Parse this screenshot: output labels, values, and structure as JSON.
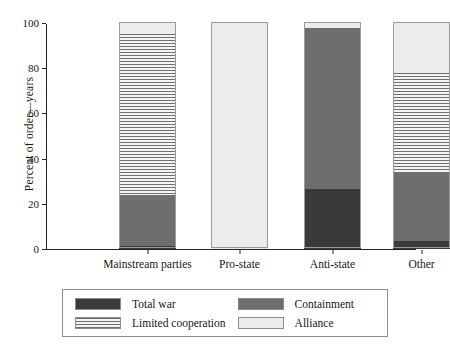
{
  "chart_data": {
    "type": "bar",
    "subtype": "stacked-bar-100",
    "title": "",
    "xlabel": "",
    "ylabel": "Percent of order—years",
    "ylim": [
      0,
      100
    ],
    "yticks": [
      0,
      20,
      40,
      60,
      80,
      100
    ],
    "ytick_labels": [
      "0",
      "20",
      "40",
      "60",
      "80",
      "100"
    ],
    "grid": false,
    "legend_position": "bottom",
    "categories": [
      "Mainstream parties",
      "Pro-state",
      "Anti-state",
      "Other"
    ],
    "series": [
      {
        "name": "Total war",
        "key": "total_war",
        "color": "#3a3a3a",
        "pattern": "solid",
        "values": [
          1.5,
          0,
          26.5,
          3.5
        ]
      },
      {
        "name": "Containment",
        "key": "containment",
        "color": "#6e6e6e",
        "pattern": "solid",
        "values": [
          22.5,
          0,
          71.5,
          30.5
        ]
      },
      {
        "name": "Limited cooperation",
        "key": "limited",
        "color": "#f2f2f2",
        "pattern": "hlines",
        "values": [
          71.0,
          0,
          0,
          44.0
        ]
      },
      {
        "name": "Alliance",
        "key": "alliance",
        "color": "#ececec",
        "pattern": "solid",
        "values": [
          5.0,
          100,
          2.0,
          22.0
        ]
      }
    ]
  },
  "axes": {
    "ytick_labels": [
      "100",
      "80",
      "60",
      "40",
      "20",
      "0"
    ],
    "xtick_labels": [
      "Mainstream parties",
      "Pro-state",
      "Anti-state",
      "Other"
    ],
    "ylabel": "Percent of order—years"
  },
  "legend": {
    "items": [
      {
        "label": "Total war",
        "key": "total_war"
      },
      {
        "label": "Containment",
        "key": "containment"
      },
      {
        "label": "Limited cooperation",
        "key": "limited"
      },
      {
        "label": "Alliance",
        "key": "alliance"
      }
    ]
  },
  "colors": {
    "total_war": "#3a3a3a",
    "containment": "#6e6e6e",
    "limited": "#f2f2f2",
    "alliance": "#ececec",
    "axis": "#222222",
    "text": "#171717"
  }
}
